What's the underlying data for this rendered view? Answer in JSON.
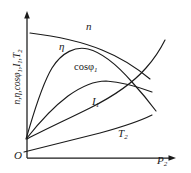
{
  "figure": {
    "kind": "induction-motor-working-characteristics",
    "background_color": "#ffffff",
    "line_color": "#1a1a1a"
  },
  "axes": {
    "origin_label": "O",
    "x_axis": {
      "name": "x-axis",
      "label_main": "P",
      "label_sub": "2",
      "arrow": "right"
    },
    "y_axis": {
      "name": "y-axis",
      "label_text": "n,η,cosφ₁,I₁,T₂",
      "arrow": "up",
      "parts": [
        {
          "main": "n",
          "sub": ""
        },
        {
          "main": "η",
          "sub": ""
        },
        {
          "main": "cosφ",
          "sub": "1"
        },
        {
          "main": "I",
          "sub": "1"
        },
        {
          "main": "T",
          "sub": "2"
        }
      ]
    }
  },
  "curves": [
    {
      "id": "n",
      "label_main": "n",
      "label_sub": "",
      "meaning": "speed",
      "path": "M 30,33 C 55,36 80,41 102,50 C 122,58 138,69 150,79"
    },
    {
      "id": "eta",
      "label_main": "η",
      "label_sub": "",
      "meaning": "efficiency",
      "path": "M 26,139 C 32,120 40,88 52,68 C 62,52 76,46 88,49 C 104,53 118,66 132,82 C 142,93 150,103 156,111"
    },
    {
      "id": "cosphi1",
      "label_main": "cosφ",
      "label_sub": "1",
      "meaning": "power factor",
      "path": "M 27,138 C 38,124 52,108 68,96 C 82,86 96,81 106,81 C 120,82 136,86 152,92"
    },
    {
      "id": "i1",
      "label_main": "I",
      "label_sub": "1",
      "meaning": "stator current",
      "path": "M 27,139 C 46,129 68,119 90,108 C 112,97 132,84 146,68 C 155,58 161,48 165,40"
    },
    {
      "id": "t2",
      "label_main": "T",
      "label_sub": "2",
      "meaning": "output torque",
      "path": "M 24,152 C 48,146 76,139 100,133 C 122,127 140,121 152,115"
    }
  ]
}
